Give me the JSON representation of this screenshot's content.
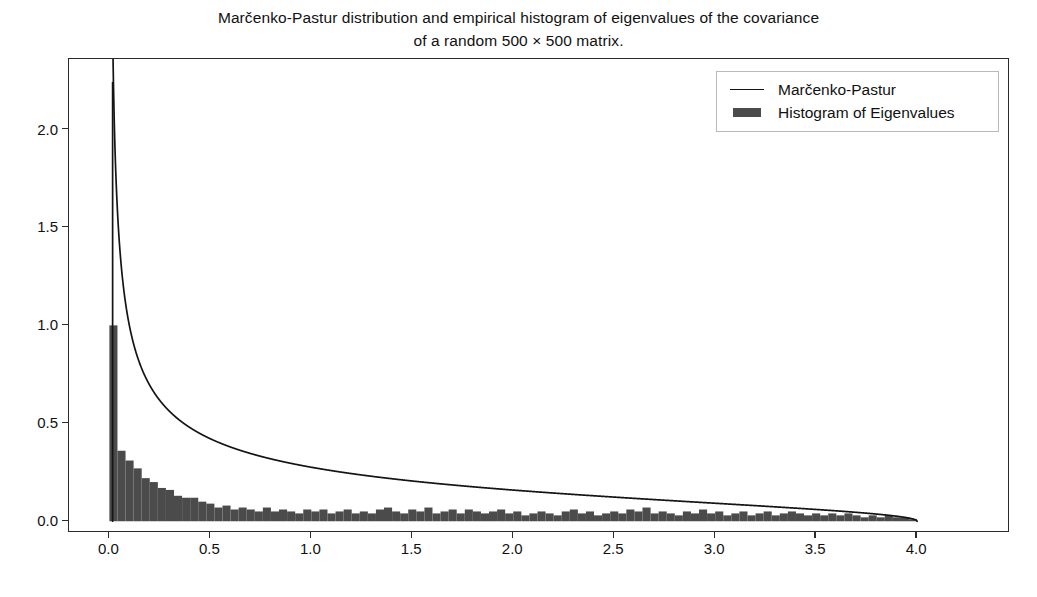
{
  "chart_data": {
    "type": "line",
    "title": "Marčenko-Pastur distribution and empirical histogram of eigenvalues of the covariance\nof a random 500 × 500 matrix.",
    "xlabel": "",
    "ylabel": "",
    "xlim": [
      -0.2,
      4.46
    ],
    "ylim": [
      -0.06,
      2.36
    ],
    "grid": false,
    "legend_position": "upper right",
    "xticks": [
      0.0,
      0.5,
      1.0,
      1.5,
      2.0,
      2.5,
      3.0,
      3.5,
      4.0
    ],
    "xtick_labels": [
      "0.0",
      "0.5",
      "1.0",
      "1.5",
      "2.0",
      "2.5",
      "3.0",
      "3.5",
      "4.0"
    ],
    "yticks": [
      0.0,
      0.5,
      1.0,
      1.5,
      2.0
    ],
    "ytick_labels": [
      "0.0",
      "0.5",
      "1.0",
      "1.5",
      "2.0"
    ],
    "series": [
      {
        "name": "Marčenko-Pastur",
        "type": "line",
        "color": "#141414",
        "linewidth": 1.7,
        "formula": "f(x) = sqrt(4 - x) / (2*pi*sqrt(x)), 0 < x <= 4",
        "x_min": 0.016,
        "x_max": 4.0,
        "peak_value": 2.24,
        "peak_x": 0.016,
        "sample_points": [
          {
            "x": 0.016,
            "y": 2.24
          },
          {
            "x": 0.05,
            "y": 1.41
          },
          {
            "x": 0.1,
            "y": 0.98
          },
          {
            "x": 0.2,
            "y": 0.69
          },
          {
            "x": 0.3,
            "y": 0.55
          },
          {
            "x": 0.5,
            "y": 0.42
          },
          {
            "x": 0.75,
            "y": 0.33
          },
          {
            "x": 1.0,
            "y": 0.276
          },
          {
            "x": 1.5,
            "y": 0.205
          },
          {
            "x": 2.0,
            "y": 0.159
          },
          {
            "x": 2.5,
            "y": 0.123
          },
          {
            "x": 3.0,
            "y": 0.092
          },
          {
            "x": 3.5,
            "y": 0.06
          },
          {
            "x": 3.8,
            "y": 0.036
          },
          {
            "x": 3.95,
            "y": 0.018
          },
          {
            "x": 4.0,
            "y": 0.0
          }
        ]
      },
      {
        "name": "Histogram of Eigenvalues",
        "type": "bar",
        "color": "#4b4b4b",
        "bin_width": 0.04,
        "bin_left_edges": [
          0.0,
          0.04,
          0.08,
          0.12,
          0.16,
          0.2,
          0.24,
          0.28,
          0.32,
          0.36,
          0.4,
          0.44,
          0.48,
          0.52,
          0.56,
          0.6,
          0.64,
          0.68,
          0.72,
          0.76,
          0.8,
          0.84,
          0.88,
          0.92,
          0.96,
          1.0,
          1.04,
          1.08,
          1.12,
          1.16,
          1.2,
          1.24,
          1.28,
          1.32,
          1.36,
          1.4,
          1.44,
          1.48,
          1.52,
          1.56,
          1.6,
          1.64,
          1.68,
          1.72,
          1.76,
          1.8,
          1.84,
          1.88,
          1.92,
          1.96,
          2.0,
          2.04,
          2.08,
          2.12,
          2.16,
          2.2,
          2.24,
          2.28,
          2.32,
          2.36,
          2.4,
          2.44,
          2.48,
          2.52,
          2.56,
          2.6,
          2.64,
          2.68,
          2.72,
          2.76,
          2.8,
          2.84,
          2.88,
          2.92,
          2.96,
          3.0,
          3.04,
          3.08,
          3.12,
          3.16,
          3.2,
          3.24,
          3.28,
          3.32,
          3.36,
          3.4,
          3.44,
          3.48,
          3.52,
          3.56,
          3.6,
          3.64,
          3.68,
          3.72,
          3.76,
          3.8,
          3.84,
          3.88,
          3.92,
          3.96
        ],
        "values": [
          1.0,
          0.36,
          0.31,
          0.27,
          0.22,
          0.2,
          0.17,
          0.16,
          0.13,
          0.12,
          0.12,
          0.1,
          0.09,
          0.07,
          0.08,
          0.06,
          0.07,
          0.06,
          0.05,
          0.07,
          0.05,
          0.06,
          0.05,
          0.04,
          0.06,
          0.05,
          0.06,
          0.04,
          0.05,
          0.06,
          0.04,
          0.05,
          0.04,
          0.06,
          0.07,
          0.05,
          0.04,
          0.06,
          0.05,
          0.07,
          0.04,
          0.05,
          0.06,
          0.04,
          0.06,
          0.05,
          0.04,
          0.05,
          0.06,
          0.04,
          0.05,
          0.03,
          0.04,
          0.05,
          0.04,
          0.03,
          0.05,
          0.06,
          0.04,
          0.05,
          0.03,
          0.04,
          0.05,
          0.04,
          0.06,
          0.05,
          0.07,
          0.04,
          0.05,
          0.04,
          0.03,
          0.05,
          0.04,
          0.06,
          0.04,
          0.05,
          0.03,
          0.04,
          0.05,
          0.03,
          0.04,
          0.05,
          0.03,
          0.04,
          0.05,
          0.04,
          0.03,
          0.04,
          0.03,
          0.04,
          0.03,
          0.04,
          0.03,
          0.02,
          0.03,
          0.02,
          0.03,
          0.02,
          0.02,
          0.01
        ]
      }
    ]
  },
  "legend": {
    "items": [
      {
        "label": "Marčenko-Pastur",
        "key": "line",
        "color": "#141414"
      },
      {
        "label": "Histogram of Eigenvalues",
        "key": "patch",
        "color": "#4b4b4b"
      }
    ]
  }
}
